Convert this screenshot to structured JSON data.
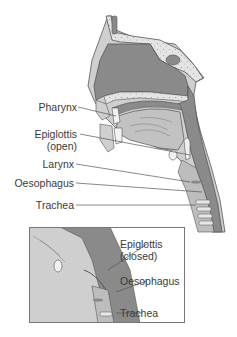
{
  "diagram": {
    "type": "anatomical cross-section",
    "colors": {
      "airway_dark": "#8a8a8a",
      "tissue_mid": "#b9b9b9",
      "tissue_light": "#d6d6d6",
      "bone_speckle": "#e6e6e6",
      "outline": "#555555",
      "label_text": "#3a3a3a",
      "leader_line": "#555555"
    },
    "main_view": {
      "labels": [
        {
          "id": "pharynx",
          "text": "Pharynx"
        },
        {
          "id": "epiglottis_open_1",
          "text": "Epiglottis"
        },
        {
          "id": "epiglottis_open_2",
          "text": "(open)"
        },
        {
          "id": "larynx",
          "text": "Larynx"
        },
        {
          "id": "oesophagus",
          "text": "Oesophagus"
        },
        {
          "id": "trachea",
          "text": "Trachea"
        }
      ]
    },
    "inset_view": {
      "labels": [
        {
          "id": "epiglottis_closed_1",
          "text": "Epiglottis"
        },
        {
          "id": "epiglottis_closed_2",
          "text": "(closed)"
        },
        {
          "id": "oesophagus",
          "text": "Oesophagus"
        },
        {
          "id": "trachea",
          "text": "Trachea"
        }
      ]
    }
  }
}
